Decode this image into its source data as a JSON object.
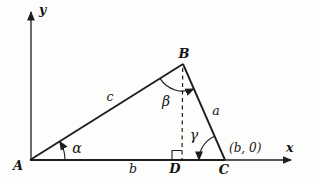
{
  "figure": {
    "background": "#fdfdfc",
    "ink_color": "#1e1e1e",
    "axes": {
      "x_label": "x",
      "y_label": "y"
    },
    "vertices": {
      "a": "A",
      "b": "B",
      "c": "C",
      "d": "D"
    },
    "sides": {
      "ab": "c",
      "bc": "a",
      "base": "b"
    },
    "angles": {
      "at_a": "α",
      "at_b": "β",
      "at_c": "γ"
    },
    "coordinate_label": "(b, 0)"
  }
}
